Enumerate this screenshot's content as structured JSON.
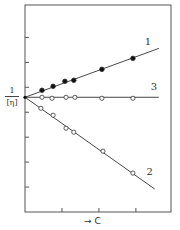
{
  "chart_data": {
    "type": "line",
    "title": "",
    "xlabel": "→ C",
    "ylabel": "1/[η]",
    "ylabel_numerator": "1",
    "ylabel_denominator": "[η]",
    "x_tick_count": 3,
    "y_tick_count": 7,
    "xlim": [
      0,
      3.95
    ],
    "ylim": [
      0,
      8.3
    ],
    "grid": false,
    "legend": "inline numeric labels at line ends",
    "intercept": 4.6,
    "series": [
      {
        "name": "1",
        "marker": "filled-circle",
        "x": [
          0.46,
          0.76,
          1.08,
          1.32,
          2.08,
          2.92
        ],
        "y": [
          4.88,
          5.04,
          5.24,
          5.28,
          5.72,
          6.16
        ],
        "line": {
          "x0": 0,
          "y0": 4.6,
          "x1": 3.62,
          "y1": 6.56
        }
      },
      {
        "name": "2",
        "marker": "open-circle",
        "x": [
          0.43,
          0.76,
          1.11,
          1.32,
          2.11,
          2.92
        ],
        "y": [
          4.16,
          3.88,
          3.36,
          3.2,
          2.44,
          1.56
        ],
        "line": {
          "x0": 0,
          "y0": 4.6,
          "x1": 3.51,
          "y1": 0.92
        }
      },
      {
        "name": "3",
        "marker": "open-circle",
        "x": [
          0.46,
          0.73,
          1.11,
          1.35,
          2.08,
          2.92
        ],
        "y": [
          4.6,
          4.56,
          4.6,
          4.6,
          4.56,
          4.56
        ],
        "line": {
          "x0": 0,
          "y0": 4.6,
          "x1": 3.62,
          "y1": 4.6
        }
      }
    ],
    "line_labels": [
      {
        "text": "1",
        "x": 3.24,
        "y": 6.68
      },
      {
        "text": "3",
        "x": 3.4,
        "y": 4.88
      },
      {
        "text": "2",
        "x": 3.29,
        "y": 1.48
      }
    ]
  },
  "colors": {
    "axis": "#555555",
    "line": "#333333",
    "marker_fill": "#111111",
    "marker_open_fill": "#ffffff"
  }
}
